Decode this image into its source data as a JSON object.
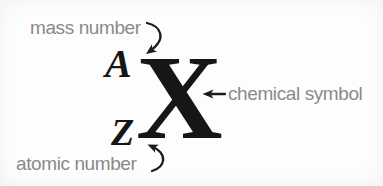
{
  "colors": {
    "background": "#fdfdfd",
    "label_gray": "#8a8a8a",
    "glyph_black": "#161616",
    "arrow_black": "#1c1c1c"
  },
  "notation": {
    "mass_number_symbol": "A",
    "atomic_number_symbol": "Z",
    "chemical_symbol_letter": "X"
  },
  "labels": {
    "mass_number": "mass number",
    "atomic_number": "atomic number",
    "chemical_symbol": "chemical symbol"
  },
  "icons": {
    "mass_number_arrow": "curved-arrow-down-left",
    "atomic_number_arrow": "curved-arrow-up-left",
    "chemical_symbol_arrow": "straight-arrow-left"
  }
}
